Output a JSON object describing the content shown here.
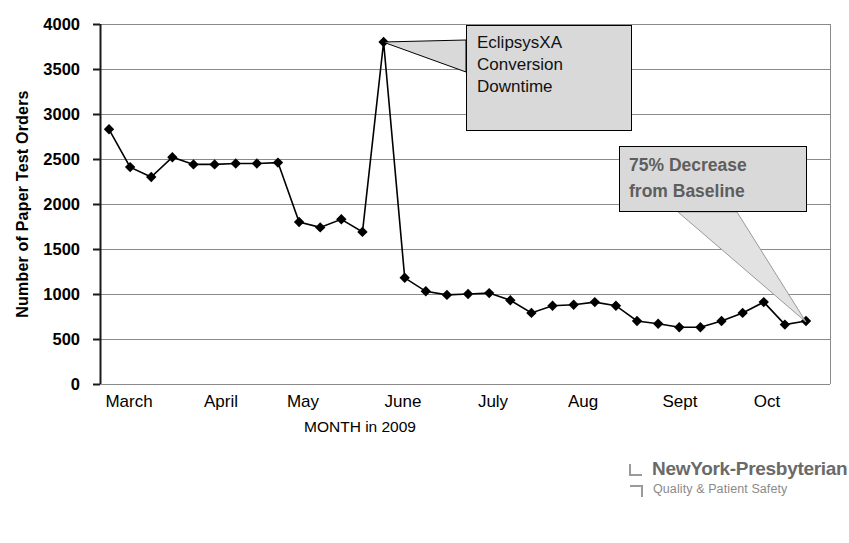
{
  "chart_data": {
    "type": "line",
    "title": "",
    "xlabel": "MONTH in 2009",
    "ylabel": "Number of Paper Test Orders",
    "ylim": [
      0,
      4000
    ],
    "ytick_step": 500,
    "yticks": [
      "0",
      "500",
      "1000",
      "1500",
      "2000",
      "2500",
      "3000",
      "3500",
      "4000"
    ],
    "xticks": [
      "March",
      "April",
      "May",
      "June",
      "July",
      "Aug",
      "Sept",
      "Oct"
    ],
    "grid": true,
    "legend": "none",
    "marker": "diamond",
    "series": [
      {
        "name": "Paper Test Orders",
        "values": [
          2830,
          2410,
          2300,
          2520,
          2440,
          2440,
          2450,
          2450,
          2460,
          1800,
          1740,
          1830,
          1690,
          3800,
          1180,
          1030,
          990,
          1000,
          1010,
          930,
          790,
          870,
          880,
          910,
          870,
          700,
          670,
          630,
          630,
          700,
          790,
          910,
          660,
          700
        ]
      }
    ],
    "annotations": [
      {
        "name": "eclipsys-conversion-downtime",
        "text_lines": [
          "EclipsysXA",
          "Conversion",
          "Downtime"
        ],
        "points_to_value": 3800
      },
      {
        "name": "percent-decrease-from-baseline",
        "text_lines": [
          "75% Decrease",
          "from Baseline"
        ],
        "points_to_value": 700
      }
    ]
  },
  "axes": {
    "y_title": "Number of Paper Test Orders",
    "x_title": "MONTH in 2009",
    "y_ticks": [
      "4000",
      "3500",
      "3000",
      "2500",
      "2000",
      "1500",
      "1000",
      "500",
      "0"
    ],
    "x_ticks": [
      "March",
      "April",
      "May",
      "June",
      "July",
      "Aug",
      "Sept",
      "Oct"
    ]
  },
  "callouts": {
    "eclipsys": {
      "line1": "EclipsysXA",
      "line2": "Conversion",
      "line3": "Downtime"
    },
    "decrease": {
      "line1": "75% Decrease",
      "line2": "from Baseline"
    }
  },
  "logo": {
    "name": "NewYork-Presbyterian",
    "tagline": "Quality & Patient Safety"
  },
  "colors": {
    "line": "#000000",
    "marker": "#000000",
    "grid": "#808080",
    "callout_fill": "#d9d9d9",
    "callout_border": "#000000",
    "decrease_text": "#5e5e5e",
    "logo_text": "#6a6a6a",
    "background": "#ffffff"
  }
}
